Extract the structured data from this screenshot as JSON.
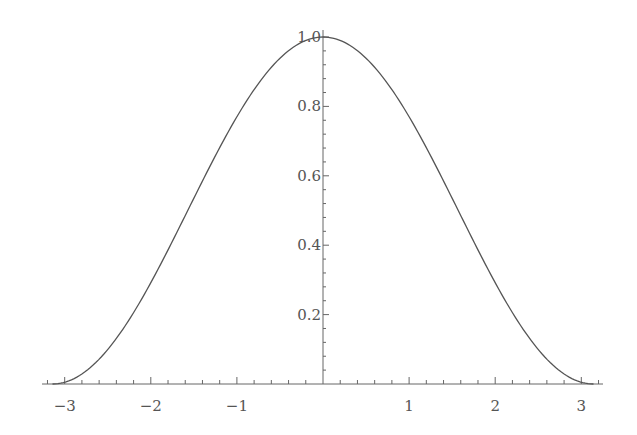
{
  "chart_data": {
    "type": "line",
    "title": "",
    "xlabel": "",
    "ylabel": "",
    "function": "cos(x)",
    "xlim": [
      -3.25,
      3.25
    ],
    "ylim": [
      0,
      1.0
    ],
    "grid": false,
    "legend": null,
    "x_ticks": [
      -3,
      -2,
      -1,
      1,
      2,
      3
    ],
    "x_tick_labels": [
      "−3",
      "−2",
      "−1",
      "1",
      "2",
      "3"
    ],
    "y_ticks": [
      0.2,
      0.4,
      0.6,
      0.8,
      1.0
    ],
    "y_tick_labels": [
      "0.2",
      "0.4",
      "0.6",
      "0.8",
      "1.0"
    ],
    "series": [
      {
        "name": "cos(x)",
        "color": "#555555",
        "x": [
          -3.1416,
          -2.5,
          -2.0,
          -1.5,
          -1.0,
          -0.5,
          0.0,
          0.5,
          1.0,
          1.5,
          2.0,
          2.5,
          3.1416
        ],
        "y": [
          -1.0,
          -0.801,
          -0.416,
          0.071,
          0.54,
          0.878,
          1.0,
          0.878,
          0.54,
          0.071,
          -0.416,
          -0.801,
          -1.0
        ]
      }
    ]
  },
  "layout": {
    "origin_px": [
      323,
      384
    ],
    "px_per_x_unit": 86.1,
    "px_per_y_unit": 347,
    "x_axis_px": [
      42,
      603
    ],
    "y_axis_top_px": 30,
    "axis_color": "#666666",
    "curve_color": "#555555"
  }
}
